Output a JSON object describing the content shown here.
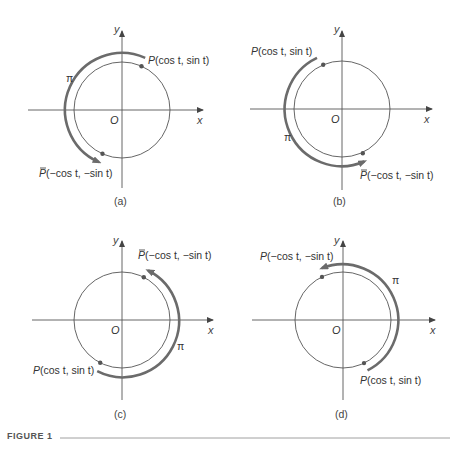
{
  "figure": {
    "label": "FIGURE 1",
    "panels": [
      {
        "id": "a",
        "caption": "(a)",
        "center": [
          122,
          110
        ],
        "radius": 48,
        "x_axis_label": "x",
        "y_axis_label": "y",
        "origin_label": "O",
        "arc_label": "π",
        "point_label": {
          "name": "P",
          "text": "(cos t, sin t)",
          "bar": false
        },
        "image_label": {
          "name": "P",
          "text": "(−cos t, −sin t)",
          "bar": true
        },
        "t_deg": 66
      },
      {
        "id": "b",
        "caption": "(b)",
        "center": [
          342,
          109
        ],
        "radius": 48,
        "x_axis_label": "x",
        "y_axis_label": "y",
        "origin_label": "O",
        "arc_label": "π",
        "point_label": {
          "name": "P",
          "text": "(cos t, sin t)",
          "bar": false
        },
        "image_label": {
          "name": "P",
          "text": "(−cos t, −sin t)",
          "bar": true
        },
        "t_deg": 113
      },
      {
        "id": "c",
        "caption": "(c)",
        "center": [
          122,
          320
        ],
        "radius": 48,
        "x_axis_label": "x",
        "y_axis_label": "y",
        "origin_label": "O",
        "arc_label": "π",
        "point_label": {
          "name": "P",
          "text": "(cos t, sin t)",
          "bar": false
        },
        "image_label": {
          "name": "P",
          "text": "(−cos t, −sin t)",
          "bar": true
        },
        "t_deg": 243
      },
      {
        "id": "d",
        "caption": "(d)",
        "center": [
          343,
          320
        ],
        "radius": 48,
        "x_axis_label": "x",
        "y_axis_label": "y",
        "origin_label": "O",
        "arc_label": "π",
        "point_label": {
          "name": "P",
          "text": "(cos t, sin t)",
          "bar": false
        },
        "image_label": {
          "name": "P",
          "text": "(−cos t, −sin t)",
          "bar": false
        },
        "t_deg": 296
      }
    ]
  }
}
